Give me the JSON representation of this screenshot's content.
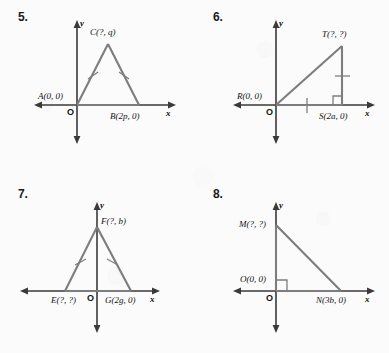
{
  "page": {
    "background_color": "#fbfbfb",
    "line_color": "#7d7d7d",
    "axis_color": "#3a3a3a",
    "label_color": "#111111"
  },
  "axis_letters": {
    "x": "x",
    "y": "y",
    "origin": "O"
  },
  "problems": [
    {
      "number": "5.",
      "name": "problem-5",
      "figure_type": "isosceles-triangle",
      "vertices": [
        {
          "label": "A(0, 0)",
          "name": "vertex-a",
          "x": 0,
          "y": 0
        },
        {
          "label": "B(2p, 0)",
          "name": "vertex-b",
          "x": 135,
          "y": 0
        },
        {
          "label": "C(?, q)",
          "name": "vertex-c",
          "x": 67,
          "y": 90
        }
      ],
      "congruence_ticks": 2,
      "right_angle": false
    },
    {
      "number": "6.",
      "name": "problem-6",
      "figure_type": "right-triangle",
      "vertices": [
        {
          "label": "R(0, 0)",
          "name": "vertex-r",
          "x": 0,
          "y": 0
        },
        {
          "label": "S(2a, 0)",
          "name": "vertex-s",
          "x": 118,
          "y": 0
        },
        {
          "label": "T(?, ?)",
          "name": "vertex-t",
          "x": 118,
          "y": 95
        }
      ],
      "congruence_ticks": 2,
      "right_angle": true,
      "right_angle_at": "S"
    },
    {
      "number": "7.",
      "name": "problem-7",
      "figure_type": "isosceles-triangle",
      "vertices": [
        {
          "label": "E(?, ?)",
          "name": "vertex-e",
          "x": -65,
          "y": 0
        },
        {
          "label": "G(2g, 0)",
          "name": "vertex-g",
          "x": 65,
          "y": 0
        },
        {
          "label": "F(?, b)",
          "name": "vertex-f",
          "x": 0,
          "y": 92
        }
      ],
      "congruence_ticks": 2,
      "right_angle": false
    },
    {
      "number": "8.",
      "name": "problem-8",
      "figure_type": "right-triangle",
      "vertices": [
        {
          "label": "O(0, 0)",
          "name": "vertex-o",
          "x": 0,
          "y": 0
        },
        {
          "label": "M(?, ?)",
          "name": "vertex-m",
          "x": 0,
          "y": 97
        },
        {
          "label": "N(3b, 0)",
          "name": "vertex-n",
          "x": 130,
          "y": 0
        }
      ],
      "congruence_ticks": 0,
      "right_angle": true,
      "right_angle_at": "O"
    }
  ]
}
